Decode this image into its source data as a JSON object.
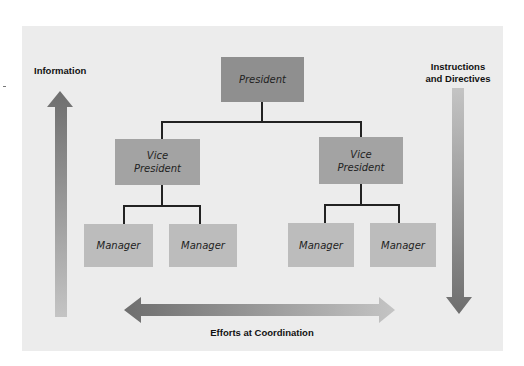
{
  "diagram": {
    "type": "org-chart-communication-flow",
    "nodes": {
      "president": {
        "label": "President"
      },
      "vp_left": {
        "label_line1": "Vice",
        "label_line2": "President"
      },
      "vp_right": {
        "label_line1": "Vice",
        "label_line2": "President"
      },
      "managers": [
        {
          "label": "Manager"
        },
        {
          "label": "Manager"
        },
        {
          "label": "Manager"
        },
        {
          "label": "Manager"
        }
      ]
    },
    "edges": [
      {
        "from": "president",
        "to": "vp_left"
      },
      {
        "from": "president",
        "to": "vp_right"
      },
      {
        "from": "vp_left",
        "to": "managers.0"
      },
      {
        "from": "vp_left",
        "to": "managers.1"
      },
      {
        "from": "vp_right",
        "to": "managers.2"
      },
      {
        "from": "vp_right",
        "to": "managers.3"
      }
    ],
    "arrows": {
      "upward": {
        "label": "Information",
        "direction": "up"
      },
      "downward": {
        "label_line1": "Instructions",
        "label_line2": "and Directives",
        "direction": "down"
      },
      "horizontal": {
        "label": "Efforts at Coordination",
        "direction": "both"
      }
    },
    "colors": {
      "panel_background": "#ececec",
      "president_fill": "#8f8f8f",
      "vp_fill": "#a3a3a3",
      "manager_fill": "#bcbcbc",
      "connector": "#222222",
      "arrow_dark": "#6e6e6e",
      "arrow_light": "#c4c4c4"
    }
  }
}
